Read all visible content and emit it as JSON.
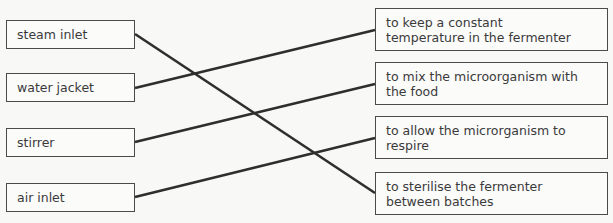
{
  "exercise": {
    "type": "matching-diagram",
    "clipped_header_remnant": "` ´",
    "line_color": "#2e2e2e",
    "box_border_color": "#4a4a4a",
    "text_color": "#3a3a3a",
    "background_color": "#f8f8f6"
  },
  "left_column": {
    "items": [
      {
        "id": "steam-inlet",
        "label": "steam inlet"
      },
      {
        "id": "water-jacket",
        "label": "water jacket"
      },
      {
        "id": "stirrer",
        "label": "stirrer"
      },
      {
        "id": "air-inlet",
        "label": "air inlet"
      }
    ]
  },
  "right_column": {
    "items": [
      {
        "id": "constant-temperature",
        "label": "to keep a constant\ntemperature in the fermenter"
      },
      {
        "id": "mix-microorganism",
        "label": "to mix the microorganism with\nthe food"
      },
      {
        "id": "allow-respire",
        "label": "to allow the microrganism to\nrespire"
      },
      {
        "id": "sterilise-fermenter",
        "label": "to sterilise the fermenter\nbetween batches"
      }
    ]
  },
  "connections": [
    {
      "from": "steam-inlet",
      "to": "sterilise-fermenter",
      "x1": 135,
      "y1": 34,
      "x2": 375,
      "y2": 193
    },
    {
      "from": "water-jacket",
      "to": "constant-temperature",
      "x1": 135,
      "y1": 88,
      "x2": 375,
      "y2": 30
    },
    {
      "from": "stirrer",
      "to": "mix-microorganism",
      "x1": 135,
      "y1": 142,
      "x2": 375,
      "y2": 84
    },
    {
      "from": "air-inlet",
      "to": "allow-respire",
      "x1": 135,
      "y1": 197,
      "x2": 375,
      "y2": 138
    }
  ]
}
